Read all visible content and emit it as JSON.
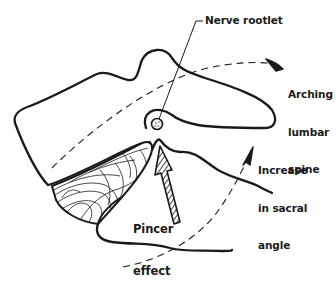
{
  "figure": {
    "type": "anatomical-diagram",
    "colors": {
      "ink": "#1a1a1a",
      "background": "#ffffff"
    }
  },
  "labels": {
    "nerve_rootlet": "Nerve rootlet",
    "arching": {
      "line1": "Arching",
      "line2": "lumbar",
      "line3": "spine"
    },
    "sacral": {
      "line1": "Increase",
      "line2": "in sacral",
      "line3": "angle"
    },
    "pincer": {
      "line1": "Pincer",
      "line2": "effect"
    }
  }
}
